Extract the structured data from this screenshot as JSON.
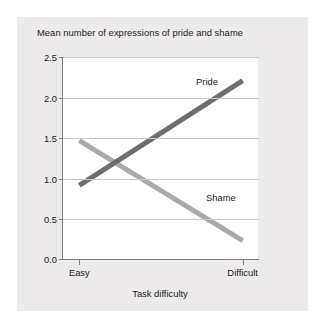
{
  "chart_data": {
    "type": "line",
    "title": "Mean number of expressions of pride and shame",
    "xlabel": "Task difficulty",
    "ylabel": "",
    "categories": [
      "Easy",
      "Difficult"
    ],
    "x": [
      0,
      1
    ],
    "xlim": [
      -0.1,
      1.1
    ],
    "ylim": [
      0.0,
      2.5
    ],
    "yticks": [
      "0.0",
      "0.5",
      "1.0",
      "1.5",
      "2.0",
      "2.5"
    ],
    "ytick_values": [
      0.0,
      0.5,
      1.0,
      1.5,
      2.0,
      2.5
    ],
    "grid": true,
    "legend_position": "inline-annotations",
    "series": [
      {
        "name": "Pride",
        "values": [
          0.92,
          2.21
        ],
        "color": "#6e6e6e"
      },
      {
        "name": "Shame",
        "values": [
          1.47,
          0.24
        ],
        "color": "#aaaaaa"
      }
    ],
    "annotations": [
      {
        "text": "Pride",
        "series": "Pride"
      },
      {
        "text": "Shame",
        "series": "Shame"
      }
    ]
  },
  "colors": {
    "card_background": "#eceaea",
    "plot_background": "#ffffff",
    "axis": "#7e7e7e",
    "gridline": "#c9c9c9",
    "text": "#1a1a1a",
    "pride_line": "#6e6e6e",
    "shame_line": "#aaaaaa"
  }
}
